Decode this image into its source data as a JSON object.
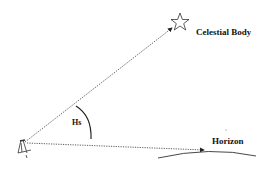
{
  "diagram": {
    "labels": {
      "celestial_body": "Celestial Body",
      "horizon": "Horizon",
      "angle": "Hs"
    },
    "icons": {
      "star": "star-icon",
      "observer": "sextant-icon"
    },
    "colors": {
      "line": "#222222",
      "background": "#ffffff"
    }
  }
}
